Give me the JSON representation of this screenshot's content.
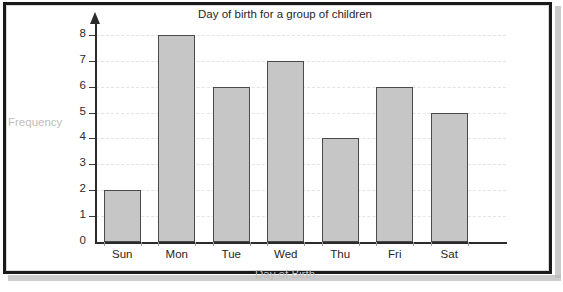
{
  "chart_data": {
    "type": "bar",
    "title": "Day of birth for a group of children",
    "xlabel": "Day of Birth",
    "ylabel": "Frequency",
    "categories": [
      "Sun",
      "Mon",
      "Tue",
      "Wed",
      "Thu",
      "Fri",
      "Sat"
    ],
    "values": [
      2,
      8,
      6,
      7,
      4,
      6,
      5
    ],
    "ylim": [
      0,
      8
    ],
    "yticks": [
      0,
      1,
      2,
      3,
      4,
      5,
      6,
      7,
      8
    ],
    "ytick_labels": [
      "0",
      "1",
      "2",
      "3",
      "4",
      "5",
      "6",
      "7",
      "8"
    ],
    "grid": true,
    "grid_style": "dashed",
    "legend": null,
    "colors": {
      "bar_fill": "#c6c6c6",
      "bar_stroke": "#4a4a4a",
      "axis": "#2b2b2b",
      "grid": "#e3e3ea",
      "title_text": "#262626",
      "axis_label_text": "#bdbdbd",
      "tick_text": "#262626",
      "frame": "#1a1a1a"
    }
  }
}
